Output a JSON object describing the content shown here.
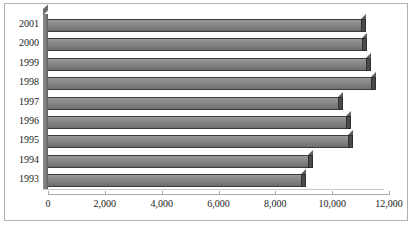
{
  "chart_data": {
    "type": "bar",
    "orientation": "horizontal",
    "title": "",
    "subtitle": "",
    "xlabel": "",
    "ylabel": "",
    "categories": [
      "2001",
      "2000",
      "1999",
      "1998",
      "1997",
      "1996",
      "1995",
      "1994",
      "1993"
    ],
    "values": [
      11000,
      11050,
      11200,
      11350,
      10200,
      10500,
      10550,
      9150,
      8900
    ],
    "series": [
      {
        "name": "",
        "values": [
          11000,
          11050,
          11200,
          11350,
          10200,
          10500,
          10550,
          9150,
          8900
        ]
      }
    ],
    "xlim": [
      0,
      12000
    ],
    "xticks": [
      0,
      2000,
      4000,
      6000,
      8000,
      10000,
      12000
    ],
    "xticklabels": [
      "0",
      "2,000",
      "4,000",
      "6,000",
      "8,000",
      "10,000",
      "12,000"
    ],
    "grid": false,
    "legend": false,
    "legend_position": "none",
    "style": "3d-bar",
    "bar_color": "#848484",
    "bar_edge_color": "#3d3d3d",
    "bar_depth_color": "#4a4a4a",
    "axis_color": "#a8a8a8",
    "frame_color": "#b0b0b0",
    "background_color": "#ffffff",
    "text_color": "#1a1a1a"
  }
}
